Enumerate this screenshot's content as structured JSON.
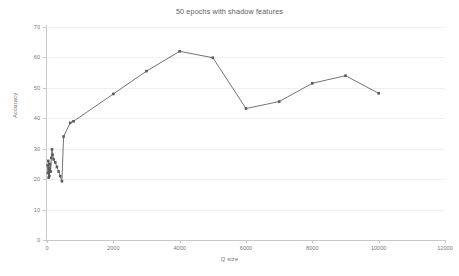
{
  "chart_data": {
    "type": "line",
    "title": "50 epochs with shadow features",
    "xlabel": "Q size",
    "ylabel": "Accuracy",
    "xlim": [
      0,
      12000
    ],
    "ylim": [
      0,
      70
    ],
    "grid": true,
    "legend": false,
    "legend_position": "none",
    "xticks": [
      0,
      2000,
      4000,
      6000,
      8000,
      10000,
      12000
    ],
    "xtick_labels": [
      "0",
      "2000",
      "4000",
      "6000",
      "8000",
      "10000",
      "12000"
    ],
    "yticks": [
      0,
      10,
      20,
      30,
      40,
      50,
      60,
      70
    ],
    "ytick_labels": [
      "0",
      "10",
      "20",
      "30",
      "40",
      "50",
      "60",
      "70"
    ],
    "series": [
      {
        "name": "Accuracy",
        "color": "#5a5a5a",
        "marker": "square",
        "x": [
          20,
          30,
          40,
          50,
          60,
          70,
          90,
          110,
          130,
          150,
          170,
          200,
          250,
          300,
          350,
          400,
          450,
          500,
          700,
          800,
          2000,
          3000,
          4000,
          5000,
          6000,
          7000,
          8000,
          9000,
          10000
        ],
        "y": [
          24.5,
          22.0,
          26.0,
          20.5,
          23.5,
          21.0,
          25.0,
          22.5,
          27.0,
          29.8,
          28.0,
          26.5,
          25.5,
          24.0,
          22.5,
          21.0,
          19.3,
          34.0,
          38.5,
          39.0,
          48.0,
          55.5,
          62.0,
          59.9,
          43.2,
          45.5,
          51.5,
          54.0,
          48.2
        ]
      }
    ]
  }
}
